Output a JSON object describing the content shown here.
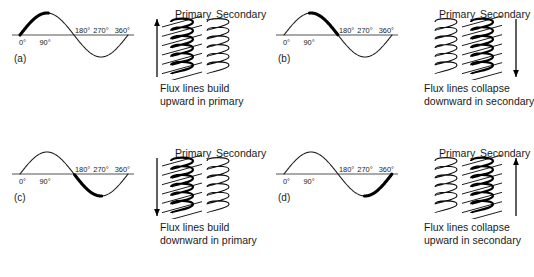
{
  "figure": {
    "background_color": "#ffffff",
    "axis_color": "#8c8c8c",
    "wave_color": "#1a1a1a",
    "highlight_color": "#000000"
  },
  "axis_labels": {
    "deg_0": "0°",
    "deg_90": "90°",
    "deg_180": "180°",
    "deg_270": "270°",
    "deg_360": "360°"
  },
  "coil_headings": {
    "primary": "Primary",
    "secondary": "Secondary"
  },
  "panels": [
    {
      "tag": "(a)",
      "caption_line1": "Flux lines build",
      "caption_line2": "upward in primary",
      "highlight_segment": "0°–90°",
      "highlight_start_deg": 0,
      "highlight_end_deg": 95,
      "flux_on": "primary",
      "arrow_direction": "up",
      "arrow_side": "left"
    },
    {
      "tag": "(b)",
      "caption_line1": "Flux lines collapse",
      "caption_line2": "downward in secondary",
      "highlight_segment": "90°–180°",
      "highlight_start_deg": 85,
      "highlight_end_deg": 180,
      "flux_on": "secondary",
      "arrow_direction": "down",
      "arrow_side": "right"
    },
    {
      "tag": "(c)",
      "caption_line1": "Flux lines build",
      "caption_line2": "downward in primary",
      "highlight_segment": "180°–270°",
      "highlight_start_deg": 182,
      "highlight_end_deg": 272,
      "flux_on": "primary",
      "arrow_direction": "down",
      "arrow_side": "left"
    },
    {
      "tag": "(d)",
      "caption_line1": "Flux lines collapse",
      "caption_line2": "upward in secondary",
      "highlight_segment": "270°–360°",
      "highlight_start_deg": 268,
      "highlight_end_deg": 360,
      "flux_on": "secondary",
      "arrow_direction": "up",
      "arrow_side": "right"
    }
  ],
  "chart_data": {
    "type": "line",
    "xlabel": "",
    "ylabel": "",
    "x": [
      0,
      90,
      180,
      270,
      360
    ],
    "tick_labels": [
      "0°",
      "90°",
      "180°",
      "270°",
      "360°"
    ],
    "xlim": [
      0,
      360
    ],
    "ylim": [
      -1,
      1
    ],
    "grid": false,
    "legend": "none",
    "series": [
      {
        "name": "sine",
        "values": [
          0,
          1,
          0,
          -1,
          0
        ]
      }
    ],
    "highlighted_quarters": [
      {
        "panel": "(a)",
        "range_deg": [
          0,
          90
        ]
      },
      {
        "panel": "(b)",
        "range_deg": [
          90,
          180
        ]
      },
      {
        "panel": "(c)",
        "range_deg": [
          180,
          270
        ]
      },
      {
        "panel": "(d)",
        "range_deg": [
          270,
          360
        ]
      }
    ]
  }
}
